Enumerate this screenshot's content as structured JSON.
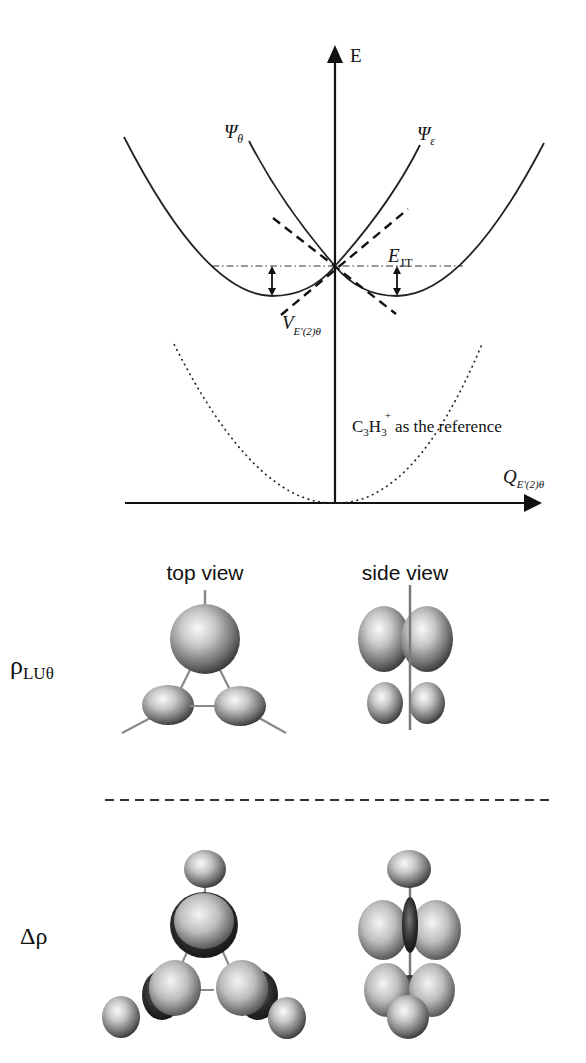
{
  "diagram": {
    "energy_plot": {
      "y_axis_label": "E",
      "x_axis_label_main": "Q",
      "x_axis_label_sub": "E'(2)θ",
      "curve_labels": {
        "psi_theta": {
          "main": "Ψ",
          "sub": "θ"
        },
        "psi_epsilon": {
          "main": "Ψ",
          "sub": "ε"
        }
      },
      "jt_energy_label": {
        "main": "E",
        "sub": "JT"
      },
      "vibronic_coupling_label": {
        "main": "V",
        "sub": "E'(2)θ"
      },
      "reference_label": {
        "prefix": "C",
        "sub1": "3",
        "mid": "H",
        "sub2": "3",
        "sup": "+",
        "suffix": " as the reference"
      },
      "line_styles": {
        "adiabatic_curves": "solid",
        "tangent_lines": "dashed",
        "crossing_level": "dash-dot",
        "reference_curve": "dotted"
      }
    },
    "orbital_panel": {
      "column_headers": [
        "top view",
        "side view"
      ],
      "rows": [
        {
          "label_main": "ρ",
          "label_sub": "LUθ",
          "name": "lumo-density"
        },
        {
          "label_main": "Δρ",
          "label_sub": "",
          "name": "density-difference"
        }
      ],
      "separator": "dashed"
    },
    "colors": {
      "ink": "#111111",
      "lobe_highlight": "#f2f2f2",
      "lobe_mid": "#9a9a9a",
      "lobe_shadow": "#2a2a2a",
      "bond": "#8a8a8a"
    }
  }
}
